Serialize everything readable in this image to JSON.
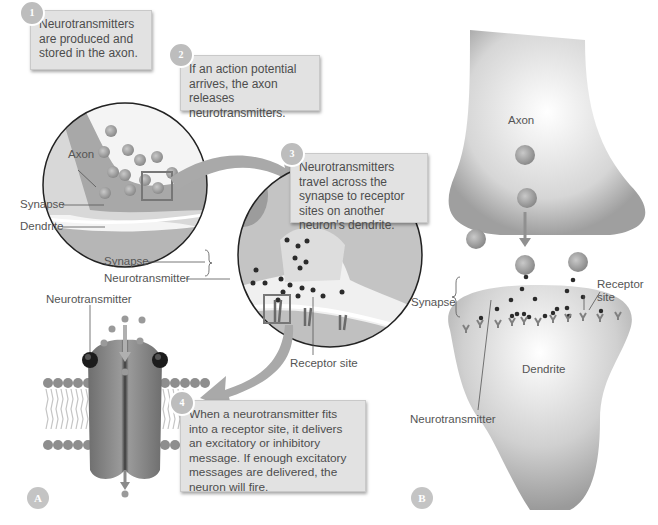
{
  "figure": {
    "panels": [
      "A",
      "B"
    ]
  },
  "panel_a": {
    "steps": [
      {
        "number": "1",
        "text": "Neurotransmitters are produced and stored in the axon."
      },
      {
        "number": "2",
        "text": "If an action potential arrives, the axon releases neurotransmitters."
      },
      {
        "number": "3",
        "text": "Neurotransmitters travel across the synapse to receptor sites on another neuron's dendrite."
      },
      {
        "number": "4",
        "text": "When a neurotransmitter fits into a receptor site, it delivers an excitatory or inhibitory message. If enough excitatory messages are delivered, the neuron will fire."
      }
    ],
    "labels": {
      "axon": "Axon",
      "synapse_small": "Synapse",
      "dendrite": "Dendrite",
      "synapse_zoom": "Synapse",
      "neurotransmitter_zoom": "Neurotransmitter",
      "neurotransmitter_channel": "Neurotransmitter",
      "receptor_site": "Receptor site"
    },
    "panel_label": "A"
  },
  "panel_b": {
    "labels": {
      "axon": "Axon",
      "synapse": "Synapse",
      "receptor_site_line1": "Receptor",
      "receptor_site_line2": "site",
      "dendrite": "Dendrite",
      "neurotransmitter": "Neurotransmitter"
    },
    "panel_label": "B"
  },
  "colors": {
    "callout_bg": "#e2e2e2",
    "badge": "#bdbdbd",
    "neuron_gray": "#b5b5b5",
    "transmitter_dot": "#2e2e2e",
    "arrow_gray": "#9a9a9a"
  }
}
